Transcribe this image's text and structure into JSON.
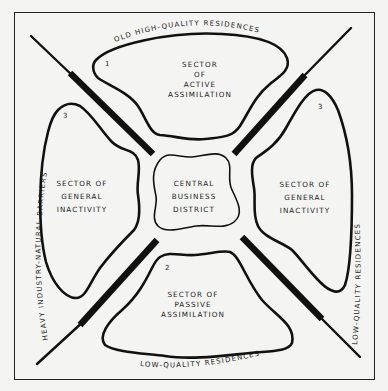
{
  "diagram": {
    "colors": {
      "ink": "#111111",
      "paper": "#f4f4f2"
    },
    "center": {
      "lines": [
        "CENTRAL",
        "BUSINESS",
        "DISTRICT"
      ]
    },
    "sectors": {
      "top": {
        "number": "1",
        "lines": [
          "SECTOR",
          "OF",
          "ACTIVE",
          "ASSIMILATION"
        ]
      },
      "bottom": {
        "number": "2",
        "lines": [
          "SECTOR OF",
          "PASSIVE",
          "ASSIMILATION"
        ]
      },
      "left": {
        "number": "3",
        "lines": [
          "SECTOR OF",
          "GENERAL",
          "INACTIVITY"
        ]
      },
      "right": {
        "number": "3",
        "lines": [
          "SECTOR OF",
          "GENERAL",
          "INACTIVITY"
        ]
      }
    },
    "edge_labels": {
      "top": "OLD  HIGH-QUALITY  RESIDENCES",
      "bottom": "LOW-QUALITY  RESIDENCES",
      "left": "HEAVY  INDUSTRY-NATURAL  BARRIERS",
      "right": "LOW-QUALITY  RESIDENCES"
    }
  }
}
